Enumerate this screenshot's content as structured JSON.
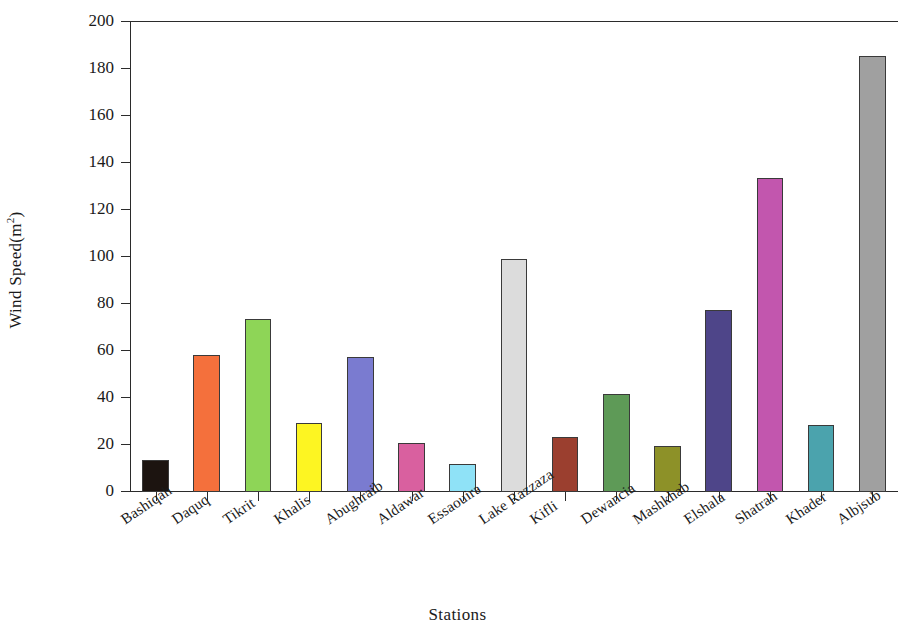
{
  "chart_data": {
    "type": "bar",
    "title": "",
    "xlabel": "Stations",
    "ylabel": "Wind Speed(m",
    "ylabel_sup": "2",
    "ylabel_tail": ")",
    "ylim": [
      0,
      200
    ],
    "ytick_step": 20,
    "grid": false,
    "legend": "none",
    "categories": [
      "Bashiqah",
      "Daquq",
      "Tikrit",
      "Khalis",
      "Abughraib",
      "Aldawar",
      "Essaouira",
      "Lake Razzaza",
      "Kifli",
      "Dewancia",
      "Mashkhab",
      "Elshala",
      "Shatrah",
      "Khader",
      "Albjsub"
    ],
    "values": [
      13.8,
      58.5,
      73.5,
      29.2,
      57.3,
      20.8,
      11.8,
      99.2,
      23.6,
      41.5,
      19.7,
      77.6,
      133.8,
      28.4,
      185.5
    ],
    "colors": [
      "#1c1410",
      "#f4703c",
      "#8ed557",
      "#fdf522",
      "#7a7bd0",
      "#d9609f",
      "#8fe2f7",
      "#dcdcdc",
      "#9b3f2f",
      "#5e9a57",
      "#8d9128",
      "#4e4589",
      "#c256ae",
      "#4ba3ad",
      "#a0a0a0"
    ],
    "ytick_labels": [
      "0",
      "20",
      "40",
      "60",
      "80",
      "100",
      "120",
      "140",
      "160",
      "180",
      "200"
    ]
  }
}
